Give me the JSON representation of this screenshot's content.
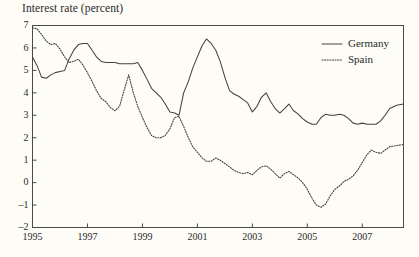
{
  "chart_data": {
    "type": "line",
    "title": "Interest rate (percent)",
    "xlabel": "",
    "ylabel": "",
    "ylim": [
      -2,
      7
    ],
    "xlim": [
      1995.0,
      2008.5
    ],
    "grid": false,
    "legend_position": "top-right",
    "ytick_labels": [
      "7",
      "6",
      "5",
      "4",
      "3",
      "2",
      "1",
      "0",
      "-1",
      "-2"
    ],
    "yticks": [
      7,
      6,
      5,
      4,
      3,
      2,
      1,
      0,
      -1,
      -2
    ],
    "xtick_labels": [
      "1995",
      "1997",
      "1999",
      "2001",
      "2003",
      "2005",
      "2007"
    ],
    "xticks": [
      1995,
      1997,
      1999,
      2001,
      2003,
      2005,
      2007
    ],
    "series": [
      {
        "name": "Germany",
        "style": "solid",
        "color": "#44423c",
        "x": [
          1995.0,
          1995.17,
          1995.33,
          1995.5,
          1995.67,
          1995.83,
          1996.0,
          1996.17,
          1996.33,
          1996.5,
          1996.67,
          1996.83,
          1997.0,
          1997.17,
          1997.33,
          1997.5,
          1997.67,
          1997.83,
          1998.0,
          1998.17,
          1998.33,
          1998.5,
          1998.67,
          1998.83,
          1999.0,
          1999.17,
          1999.33,
          1999.5,
          1999.67,
          1999.83,
          2000.0,
          2000.17,
          2000.33,
          2000.5,
          2000.67,
          2000.83,
          2001.0,
          2001.17,
          2001.33,
          2001.5,
          2001.67,
          2001.83,
          2002.0,
          2002.17,
          2002.33,
          2002.5,
          2002.67,
          2002.83,
          2003.0,
          2003.17,
          2003.33,
          2003.5,
          2003.67,
          2003.83,
          2004.0,
          2004.17,
          2004.33,
          2004.5,
          2004.67,
          2004.83,
          2005.0,
          2005.17,
          2005.33,
          2005.5,
          2005.67,
          2005.83,
          2006.0,
          2006.17,
          2006.33,
          2006.5,
          2006.67,
          2006.83,
          2007.0,
          2007.17,
          2007.33,
          2007.5,
          2007.67,
          2007.83,
          2008.0,
          2008.25,
          2008.5
        ],
        "y": [
          5.6,
          5.2,
          4.7,
          4.65,
          4.8,
          4.9,
          4.95,
          5.0,
          5.5,
          5.9,
          6.15,
          6.2,
          6.2,
          5.9,
          5.6,
          5.4,
          5.35,
          5.35,
          5.35,
          5.3,
          5.3,
          5.3,
          5.3,
          5.35,
          5.0,
          4.6,
          4.2,
          4.0,
          3.8,
          3.5,
          3.15,
          3.1,
          3.0,
          4.0,
          4.5,
          5.1,
          5.6,
          6.1,
          6.4,
          6.2,
          5.9,
          5.4,
          4.7,
          4.1,
          3.95,
          3.85,
          3.7,
          3.55,
          3.15,
          3.4,
          3.8,
          4.0,
          3.6,
          3.3,
          3.1,
          3.3,
          3.5,
          3.2,
          3.05,
          2.85,
          2.7,
          2.6,
          2.6,
          2.9,
          3.05,
          3.0,
          3.0,
          3.05,
          3.0,
          2.85,
          2.65,
          2.6,
          2.65,
          2.6,
          2.6,
          2.6,
          2.75,
          3.0,
          3.3,
          3.45,
          3.5
        ]
      },
      {
        "name": "Spain",
        "style": "dotted",
        "color": "#44423c",
        "x": [
          1995.0,
          1995.17,
          1995.33,
          1995.5,
          1995.67,
          1995.83,
          1996.0,
          1996.17,
          1996.33,
          1996.5,
          1996.67,
          1996.83,
          1997.0,
          1997.17,
          1997.33,
          1997.5,
          1997.67,
          1997.83,
          1998.0,
          1998.17,
          1998.33,
          1998.5,
          1998.67,
          1998.83,
          1999.0,
          1999.17,
          1999.33,
          1999.5,
          1999.67,
          1999.83,
          2000.0,
          2000.17,
          2000.33,
          2000.5,
          2000.67,
          2000.83,
          2001.0,
          2001.17,
          2001.33,
          2001.5,
          2001.67,
          2001.83,
          2002.0,
          2002.17,
          2002.33,
          2002.5,
          2002.67,
          2002.83,
          2003.0,
          2003.17,
          2003.33,
          2003.5,
          2003.67,
          2003.83,
          2004.0,
          2004.17,
          2004.33,
          2004.5,
          2004.67,
          2004.83,
          2005.0,
          2005.17,
          2005.33,
          2005.5,
          2005.67,
          2005.83,
          2006.0,
          2006.17,
          2006.33,
          2006.5,
          2006.67,
          2006.83,
          2007.0,
          2007.17,
          2007.33,
          2007.5,
          2007.67,
          2007.83,
          2008.0,
          2008.25,
          2008.5
        ],
        "y": [
          6.9,
          6.85,
          6.6,
          6.3,
          6.15,
          6.2,
          5.95,
          5.6,
          5.35,
          5.4,
          5.5,
          5.25,
          4.9,
          4.5,
          4.1,
          3.75,
          3.6,
          3.35,
          3.2,
          3.4,
          4.1,
          4.8,
          4.0,
          3.4,
          2.9,
          2.45,
          2.1,
          2.0,
          2.0,
          2.1,
          2.4,
          2.9,
          2.95,
          2.5,
          2.0,
          1.6,
          1.35,
          1.1,
          0.95,
          0.95,
          1.1,
          1.0,
          0.85,
          0.7,
          0.55,
          0.45,
          0.4,
          0.45,
          0.35,
          0.55,
          0.7,
          0.75,
          0.6,
          0.4,
          0.2,
          0.4,
          0.5,
          0.35,
          0.2,
          0.0,
          -0.3,
          -0.7,
          -1.0,
          -1.1,
          -0.95,
          -0.6,
          -0.3,
          -0.15,
          0.05,
          0.15,
          0.3,
          0.55,
          0.9,
          1.25,
          1.45,
          1.35,
          1.3,
          1.45,
          1.6,
          1.65,
          1.7
        ]
      }
    ]
  },
  "legend": {
    "items": [
      {
        "label": "Germany",
        "style": "solid"
      },
      {
        "label": "Spain",
        "style": "dotted"
      }
    ]
  }
}
